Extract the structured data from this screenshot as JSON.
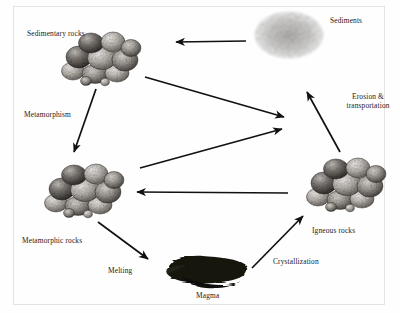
{
  "diagram": {
    "background_color": "#fefefe",
    "frame_color": "#e3e3e3",
    "ink_color": "#111111",
    "nodes": [
      {
        "id": "sedimentary-rocks",
        "label": "Sedimentary rocks",
        "kind": "rock-cluster",
        "label_x": 27,
        "label_y": 29,
        "art_x": 55,
        "art_y": 30,
        "art_w": 90,
        "art_h": 52
      },
      {
        "id": "sediments",
        "label": "Sediments",
        "kind": "sediment-blob",
        "label_x": 330,
        "label_y": 16,
        "art_x": 253,
        "art_y": 10,
        "art_w": 72,
        "art_h": 50
      },
      {
        "id": "metamorphic-rocks",
        "label": "Metamorphic rocks",
        "kind": "rock-cluster",
        "label_x": 22,
        "label_y": 236,
        "art_x": 38,
        "art_y": 162,
        "art_w": 90,
        "art_h": 55
      },
      {
        "id": "igneous-rocks",
        "label": "Igneous rocks",
        "kind": "rock-cluster",
        "label_x": 312,
        "label_y": 226,
        "art_x": 302,
        "art_y": 156,
        "art_w": 85,
        "art_h": 55
      },
      {
        "id": "magma",
        "label": "Magma",
        "kind": "magma-blob",
        "label_x": 196,
        "label_y": 291,
        "art_x": 163,
        "art_y": 256,
        "art_w": 84,
        "art_h": 30
      }
    ],
    "process_labels": [
      {
        "id": "metamorphism",
        "label": "Metamorphism",
        "x": 24,
        "y": 110
      },
      {
        "id": "melting",
        "label": "Melting",
        "x": 108,
        "y": 266
      },
      {
        "id": "crystallization",
        "label": "Crystallization",
        "x": 273,
        "y": 257
      },
      {
        "id": "erosion-and-transportation",
        "label": "Erosion &\ntransportation",
        "x": 340,
        "y": 92
      }
    ],
    "arrows": [
      {
        "id": "arrow-sediments-to-sedimentary",
        "from": "sediments",
        "to": "sedimentary-rocks",
        "x1": 246,
        "y1": 41,
        "x2": 172,
        "y2": 42
      },
      {
        "id": "arrow-sedimentary-to-erosion-hub",
        "from": "sedimentary-rocks",
        "to": "hub",
        "x1": 145,
        "y1": 77,
        "x2": 288,
        "y2": 118
      },
      {
        "id": "arrow-metamorphic-to-hub",
        "from": "metamorphic-rocks",
        "to": "hub",
        "x1": 140,
        "y1": 168,
        "x2": 286,
        "y2": 128
      },
      {
        "id": "arrow-igneous-to-metamorphic",
        "from": "igneous-rocks",
        "to": "metamorphic-rocks",
        "x1": 288,
        "y1": 193,
        "x2": 133,
        "y2": 192
      },
      {
        "id": "arrow-erosion-transportation",
        "from": "igneous-rocks",
        "to": "sediments",
        "x1": 340,
        "y1": 152,
        "x2": 305,
        "y2": 88
      },
      {
        "id": "arrow-metamorphism",
        "from": "sedimentary-rocks",
        "to": "metamorphic-rocks",
        "x1": 96,
        "y1": 89,
        "x2": 73,
        "y2": 157
      },
      {
        "id": "arrow-melting",
        "from": "metamorphic-rocks",
        "to": "magma",
        "x1": 98,
        "y1": 222,
        "x2": 152,
        "y2": 263
      },
      {
        "id": "arrow-crystallization",
        "from": "magma",
        "to": "igneous-rocks",
        "x1": 252,
        "y1": 268,
        "x2": 306,
        "y2": 213
      }
    ]
  }
}
